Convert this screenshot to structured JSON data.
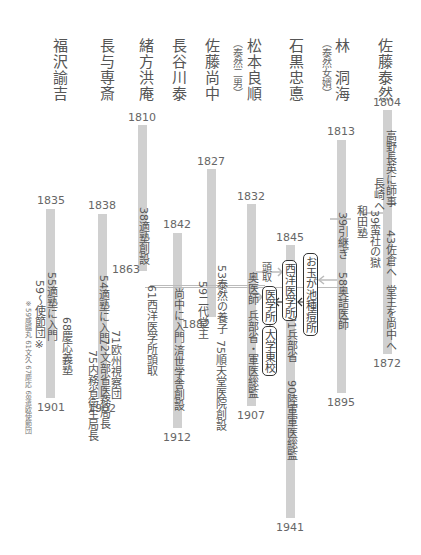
{
  "colors": {
    "bar": "#d0d0d0",
    "text": "#555555",
    "line": "#bbbbbb",
    "box_border": "#333333"
  },
  "people": [
    {
      "id": "fukuzawa",
      "name": "福沢諭吉",
      "birth": "1835",
      "death": "1901",
      "events": [
        "55適塾に入門",
        "59〜使節団※",
        "68慶応義塾"
      ],
      "note": "※59咸臨丸 61文久 67慶応 68遣欧使節団"
    },
    {
      "id": "nagayo",
      "name": "長与専斎",
      "birth": "1838",
      "death": "1902",
      "events": [
        "54適塾に入門",
        "71欧州視察団",
        "72文部省医務局長",
        "75内務省衛生局長"
      ]
    },
    {
      "id": "ogata",
      "name": "緒方洪庵",
      "birth": "1810",
      "death": "1863",
      "events": [
        "38適塾創設",
        "61西洋医学所頭取"
      ]
    },
    {
      "id": "hasegawa",
      "name": "長谷川泰",
      "birth": "1842",
      "death": "1912",
      "events": [
        "尚中に入門",
        "済世学舎創設"
      ]
    },
    {
      "id": "sato_naonaka",
      "name": "佐藤尚中",
      "birth": "1827",
      "death": "1882",
      "events": [
        "53泰然の養子",
        "59二代堂主",
        "75順天堂医院創設"
      ]
    },
    {
      "id": "matsumoto",
      "name": "松本良順",
      "sub": "（泰然二男）",
      "birth": "1832",
      "death": "1907",
      "events": [
        "奥医師",
        "兵部省・軍医総監",
        "頭取"
      ]
    },
    {
      "id": "ishiguro",
      "name": "石黒忠悳",
      "birth": "1845",
      "death": "1941",
      "events": [
        "71兵部省",
        "90陸軍軍医総監"
      ]
    },
    {
      "id": "hayashi",
      "name": "林　洞海",
      "sub": "（泰然女婿）",
      "birth": "1813",
      "death": "1895",
      "events": [
        "39引継ぎ",
        "58奥詰医師"
      ]
    },
    {
      "id": "sato_taizen",
      "name": "佐藤泰然",
      "birth": "1804",
      "death": "1872",
      "events": [
        "高野長英に師事",
        "長崎へ",
        "39蛮社の獄",
        "43佐倉へ",
        "堂主を尚中へ"
      ]
    }
  ],
  "labels": {
    "wadajuku": "和田塾",
    "ev_39_hikitsugi": "39引継ぎ",
    "ev_39_bansha": "39蛮社の獄",
    "ev_takano": "高野長英に師事",
    "ev_nagasaki": "長崎へ",
    "ev_43": "43佐倉へ",
    "ev_domei": "堂主を尚中へ",
    "ev_58": "58奥詰医師",
    "ev_71_hyobu": "71兵部省",
    "ev_90": "90陸軍軍医総監",
    "ev_tori": "頭取",
    "ev_okui": "奥医師",
    "ev_hyobu": "兵部省・軍医総監",
    "ev_53": "53泰然の養子",
    "ev_59_nidai": "59二代堂主",
    "ev_75_juntendo": "75順天堂医院創設",
    "ev_naonaka": "尚中に入門",
    "ev_saisei": "済世学舎創設",
    "ev_38": "38適塾創設",
    "ev_61": "61西洋医学所頭取",
    "ev_54": "54適塾に入門",
    "ev_71_oshu": "71欧州視察団",
    "ev_72": "72文部省医務局長",
    "ev_75_naimu": "75内務省衛生局長",
    "ev_55": "55適塾に入門",
    "ev_59_shisetsu": "59〜使節団※",
    "ev_68": "68慶応義塾",
    "note": "※59咸臨丸 61文久 67慶応 68遣欧使節団",
    "box_otamagaike": "お玉が池種痘所",
    "box_seiyo": "西洋医学所",
    "box_igakusho": "医学所",
    "box_daigaku": "大学東校"
  }
}
